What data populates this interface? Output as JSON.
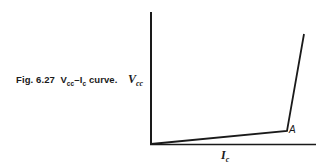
{
  "figure": {
    "caption_prefix": "Fig. 6.27",
    "caption_v": "V",
    "caption_v_sub": "cc",
    "caption_dash": "–",
    "caption_i": "I",
    "caption_i_sub": "c",
    "caption_suffix": " curve."
  },
  "axes": {
    "y_label": "V",
    "y_label_sub": "cc",
    "x_label": "I",
    "x_label_sub": "c"
  },
  "annotations": {
    "point_a": "A"
  },
  "curve": {
    "points": [
      [
        151,
        144
      ],
      [
        287,
        131
      ],
      [
        304,
        34
      ]
    ],
    "color": "#1a1a1a"
  }
}
